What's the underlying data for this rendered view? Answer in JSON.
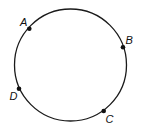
{
  "diagram": {
    "type": "circle-with-points",
    "circle": {
      "cx": 70.5,
      "cy": 65,
      "r": 56,
      "stroke": "#1a1a1a",
      "stroke_width": 1.3
    },
    "points": [
      {
        "label": "A",
        "x": 29.3,
        "y": 28.7,
        "lx": 20,
        "ly": 26
      },
      {
        "label": "B",
        "x": 123,
        "y": 47.3,
        "lx": 125.5,
        "ly": 44
      },
      {
        "label": "C",
        "x": 103.7,
        "y": 111,
        "lx": 105.5,
        "ly": 123
      },
      {
        "label": "D",
        "x": 19,
        "y": 88.7,
        "lx": 9.5,
        "ly": 100
      }
    ],
    "point_color": "#111111",
    "point_radius": 2.3
  }
}
